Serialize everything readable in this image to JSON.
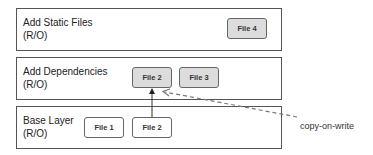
{
  "layers": [
    {
      "title": "Add Static Files",
      "mode": "(R/O)"
    },
    {
      "title": "Add Dependencies",
      "mode": "(R/O)"
    },
    {
      "title": "Base Layer",
      "mode": "(R/O)"
    }
  ],
  "files": {
    "static": [
      {
        "label": "File 4"
      }
    ],
    "dependencies": [
      {
        "label": "File 2"
      },
      {
        "label": "File 3"
      }
    ],
    "base": [
      {
        "label": "File 1"
      },
      {
        "label": "File 2"
      }
    ]
  },
  "annotation": {
    "label": "copy-on-write"
  },
  "colors": {
    "border": "#555555",
    "shaded_file": "#dcdcdc",
    "arrow": "#333333",
    "dashed": "#777777"
  }
}
